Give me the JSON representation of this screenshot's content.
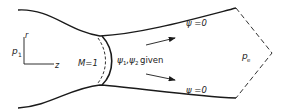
{
  "diagram": {
    "type": "nozzle flow domain",
    "colors": {
      "stroke": "#1a1a1a",
      "background": "#ffffff",
      "text": "#222222"
    },
    "axes": {
      "vertical_label": "r",
      "horizontal_label": "z"
    },
    "labels": {
      "inlet_pressure": "p",
      "inlet_pressure_sub": "1",
      "sonic_line": "M=1",
      "throat_condition_psi1": "ψ",
      "throat_condition_sub1": "1",
      "throat_condition_comma": ",",
      "throat_condition_psi2": "ψ",
      "throat_condition_sub2": "2",
      "throat_condition_text": "given",
      "upper_wall_streamline": "ψ =0",
      "lower_wall_streamline": "ψ =0",
      "exit_pressure": "p",
      "exit_pressure_sub": "e"
    },
    "elements": [
      "upper-wall",
      "lower-wall",
      "sonic-line",
      "sonic-line-dashed",
      "flow-arrow-upper",
      "flow-arrow-lower",
      "exit-boundary-dashed",
      "coordinate-axes"
    ]
  }
}
